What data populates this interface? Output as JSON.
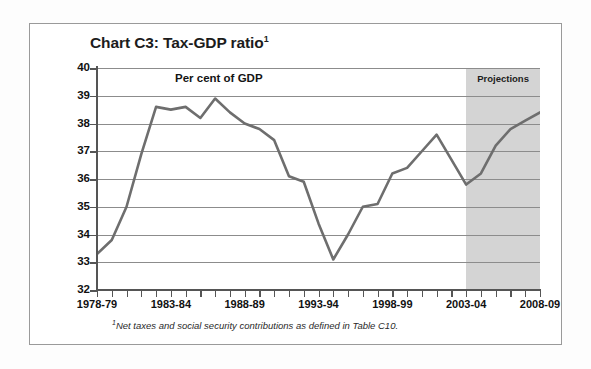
{
  "figure": {
    "title": "Chart C3: Tax-GDP ratio",
    "title_superscript": "1",
    "footnote_superscript": "1",
    "footnote": "Net taxes and social security contributions as defined in Table C10.",
    "inner_label": "Per cent of GDP",
    "projections_label": "Projections"
  },
  "colors": {
    "line": "#6e6e6e",
    "grid": "#8c8c8c",
    "axis": "#555555",
    "shade": "#d4d4d4",
    "frame": "#9a9a9a",
    "text": "#111111",
    "background": "#ffffff"
  },
  "chart_data": {
    "type": "line",
    "title": "Chart C3: Tax-GDP ratio",
    "xlabel": "",
    "ylabel": "Per cent of GDP",
    "ylim": [
      32,
      40
    ],
    "yticks": [
      32,
      33,
      34,
      35,
      36,
      37,
      38,
      39,
      40
    ],
    "ytick_labels": [
      "32",
      "33",
      "34",
      "35",
      "36",
      "37",
      "38",
      "39",
      "40"
    ],
    "grid": true,
    "legend": null,
    "x": [
      "1978-79",
      "1979-80",
      "1980-81",
      "1981-82",
      "1982-83",
      "1983-84",
      "1984-85",
      "1985-86",
      "1986-87",
      "1987-88",
      "1988-89",
      "1989-90",
      "1990-91",
      "1991-92",
      "1992-93",
      "1993-94",
      "1994-95",
      "1995-96",
      "1996-97",
      "1997-98",
      "1998-99",
      "1999-00",
      "2000-01",
      "2001-02",
      "2002-03",
      "2003-04",
      "2004-05",
      "2005-06",
      "2006-07",
      "2007-08",
      "2008-09"
    ],
    "xtick_labels": [
      "1978-79",
      "1983-84",
      "1988-89",
      "1993-94",
      "1998-99",
      "2003-04",
      "2008-09"
    ],
    "xtick_indices": [
      0,
      5,
      10,
      15,
      20,
      25,
      30
    ],
    "values": [
      33.3,
      33.8,
      35.0,
      36.9,
      38.6,
      38.5,
      38.6,
      38.2,
      38.9,
      38.4,
      38.0,
      37.8,
      37.4,
      36.1,
      35.9,
      34.4,
      33.1,
      34.0,
      35.0,
      35.1,
      36.2,
      36.4,
      37.0,
      37.6,
      36.7,
      35.8,
      36.2,
      37.2,
      37.8,
      38.1,
      38.4
    ],
    "series": [
      {
        "name": "Tax-GDP ratio",
        "values": [
          33.3,
          33.8,
          35.0,
          36.9,
          38.6,
          38.5,
          38.6,
          38.2,
          38.9,
          38.4,
          38.0,
          37.8,
          37.4,
          36.1,
          35.9,
          34.4,
          33.1,
          34.0,
          35.0,
          35.1,
          36.2,
          36.4,
          37.0,
          37.6,
          36.7,
          35.8,
          36.2,
          37.2,
          37.8,
          38.1,
          38.4
        ]
      }
    ],
    "annotations": [
      {
        "text": "Per cent of GDP",
        "position": "inside-top-center"
      },
      {
        "text": "Projections",
        "position": "inside-top-shaded"
      }
    ],
    "shaded_region": {
      "label": "Projections",
      "start_index": 25,
      "end_index": 30,
      "start_label": "2003-04",
      "end_label": "2008-09"
    }
  }
}
